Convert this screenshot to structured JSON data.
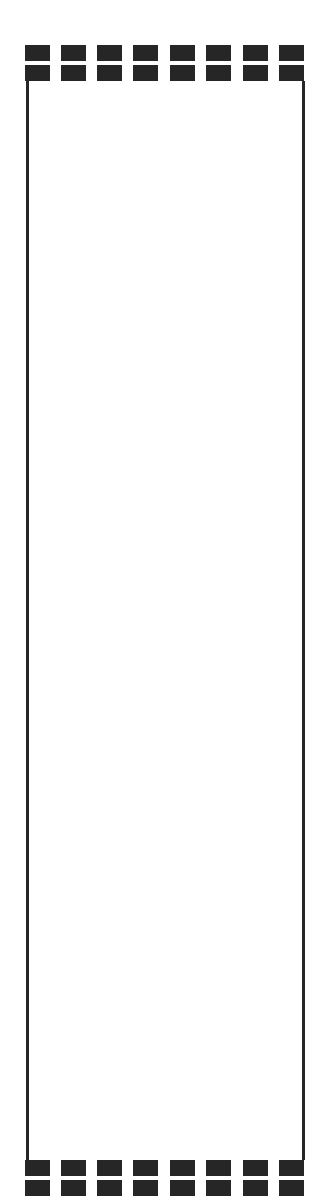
{
  "frame": {
    "color": "#262626",
    "background": "#ffffff",
    "block_columns_x": [
      25,
      61,
      97,
      133,
      170,
      206,
      243,
      279
    ],
    "block_width": 25,
    "block_height": 16,
    "rows_y": {
      "top": [
        45,
        65
      ],
      "bottom": [
        1160,
        1180
      ]
    },
    "side_lines": {
      "left_x": 26,
      "right_x": 302,
      "top_y": 81,
      "bottom_y": 1160
    }
  }
}
